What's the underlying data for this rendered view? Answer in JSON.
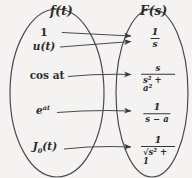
{
  "figure": {
    "type": "mapping-diagram",
    "background_color": "#f4f3f1",
    "stroke_color": "#4a4a50",
    "text_color": "#2b2b2d"
  },
  "domain_set": {
    "title": "f(t)",
    "title_x": 62,
    "title_y": 11,
    "ellipse": {
      "cx": 57,
      "cy": 93,
      "rx": 47,
      "ry": 84
    }
  },
  "codomain_set": {
    "title": "F(s)",
    "title_x": 152,
    "title_y": 11,
    "ellipse": {
      "cx": 152,
      "cy": 93,
      "rx": 36,
      "ry": 84
    }
  },
  "pairs": [
    {
      "id": "unit-constant",
      "source_label": "1",
      "source_style": "upright-bold",
      "source_x": 44,
      "source_y": 32,
      "target_numerator": "1",
      "target_denominator": "s",
      "target_x": 155,
      "target_y": 38,
      "arrow": {
        "x1": 62,
        "y1": 32,
        "x2": 130,
        "y2": 36
      }
    },
    {
      "id": "unit-step",
      "source_label": "u(t)",
      "source_style": "italic",
      "source_x": 44,
      "source_y": 46,
      "target_numerator": "1",
      "target_denominator": "s",
      "target_x": 155,
      "target_y": 38,
      "arrow": {
        "x1": 60,
        "y1": 47,
        "x2": 130,
        "y2": 41
      }
    },
    {
      "id": "cosine",
      "source_label": "cos at",
      "source_style": "upright-bold-italic-arg",
      "source_x": 47,
      "source_y": 75,
      "target_numerator": "s",
      "target_denominator": "s² + a²",
      "target_x": 158,
      "target_y": 78,
      "arrow": {
        "x1": 68,
        "y1": 76,
        "x2": 130,
        "y2": 74
      }
    },
    {
      "id": "exponential",
      "source_label": "e",
      "source_exponent": "at",
      "source_style": "italic-superscript",
      "source_x": 43,
      "source_y": 110,
      "target_numerator": "1",
      "target_denominator": "s − a",
      "target_x": 157,
      "target_y": 113,
      "arrow": {
        "x1": 57,
        "y1": 112,
        "x2": 130,
        "y2": 110
      }
    },
    {
      "id": "bessel-j0",
      "source_label": "J",
      "source_subscript": "0",
      "source_suffix": "(t)",
      "source_style": "italic-subscript",
      "source_x": 45,
      "source_y": 148,
      "target_numerator": "1",
      "target_denominator": "√s² + 1",
      "target_x": 158,
      "target_y": 150,
      "arrow": {
        "x1": 64,
        "y1": 149,
        "x2": 130,
        "y2": 146
      }
    }
  ],
  "inner_boundaries": [
    {
      "id": "domain-right-edge",
      "x_top": 86,
      "x_mid": 104,
      "x_bottom": 86
    },
    {
      "id": "codomain-left-edge",
      "x_top": 130,
      "x_mid": 116,
      "x_bottom": 130
    }
  ]
}
